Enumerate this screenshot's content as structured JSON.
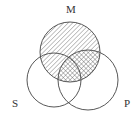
{
  "diagram": {
    "type": "venn-3",
    "labels": {
      "M": "M",
      "S": "S",
      "P": "P"
    },
    "circles": [
      {
        "id": "M",
        "cx": 70,
        "cy": 52,
        "r": 30
      },
      {
        "id": "S",
        "cx": 54,
        "cy": 80,
        "r": 27
      },
      {
        "id": "P",
        "cx": 88,
        "cy": 80,
        "r": 30
      }
    ],
    "shading": {
      "diagonal_hatch": "M",
      "cross_hatch": "M ∩ P"
    },
    "colors": {
      "stroke": "#444444",
      "hatch": "#555555",
      "background": "#ffffff"
    }
  }
}
